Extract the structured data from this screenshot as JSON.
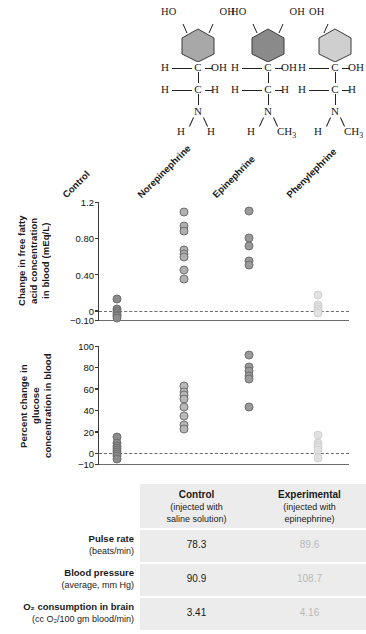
{
  "molecules": [
    {
      "name": "norepinephrine-structure",
      "ring_fill": "#a8a8a8",
      "oh_left": "HO",
      "oh_right": "OH",
      "c1_left": "H",
      "c1": "C",
      "c1_right": "OH",
      "c2_left": "H",
      "c2": "C",
      "c2_right": "H",
      "n": "N",
      "n_left": "H",
      "n_right": "H",
      "n_right_sub": ""
    },
    {
      "name": "epinephrine-structure",
      "ring_fill": "#8a8a8a",
      "oh_left": "HO",
      "oh_right": "OH",
      "c1_left": "H",
      "c1": "C",
      "c1_right": "OH",
      "c2_left": "H",
      "c2": "C",
      "c2_right": "H",
      "n": "N",
      "n_left": "H",
      "n_right": "CH",
      "n_right_sub": "3"
    },
    {
      "name": "phenylephrine-structure",
      "ring_fill": "#cfcfcf",
      "oh_left": "",
      "oh_right": "OH",
      "c1_left": "H",
      "c1": "C",
      "c1_right": "OH",
      "c2_left": "H",
      "c2": "C",
      "c2_right": "H",
      "n": "N",
      "n_left": "H",
      "n_right": "CH",
      "n_right_sub": "3"
    }
  ],
  "groups": [
    {
      "label": "Control",
      "color": "#8c8c8c"
    },
    {
      "label": "Norepinephrine",
      "color": "#b0b0b0"
    },
    {
      "label": "Epinephrine",
      "color": "#9a9a9a"
    },
    {
      "label": "Phenylephrine",
      "color": "#e2e2e2"
    }
  ],
  "chart_data": [
    {
      "type": "scatter",
      "name": "free-fatty-acid-chart",
      "title": "",
      "xlabel": "",
      "ylabel": "Change in free fatty acid concentration in blood (mEq/L)",
      "ylabel_lines": [
        "Change in free fatty",
        "acid concentration",
        "in blood (mEq/L)"
      ],
      "categories": [
        "Control",
        "Norepinephrine",
        "Epinephrine",
        "Phenylephrine"
      ],
      "ylim": [
        -0.1,
        1.2
      ],
      "yticks": [
        1.2,
        0.8,
        0.4,
        0,
        -0.1
      ],
      "ytick_labels": [
        "1.2",
        "0.80",
        "0.40",
        "0",
        "−0.10"
      ],
      "zero_reference": 0,
      "grid": false,
      "legend": "none",
      "series": [
        {
          "name": "Control",
          "color": "#8c8c8c",
          "values": [
            0.13,
            0.02,
            0.0,
            -0.02,
            -0.04,
            -0.06,
            -0.08
          ]
        },
        {
          "name": "Norepinephrine",
          "color": "#b0b0b0",
          "values": [
            1.09,
            0.94,
            0.88,
            0.67,
            0.63,
            0.59,
            0.45,
            0.35
          ]
        },
        {
          "name": "Epinephrine",
          "color": "#9a9a9a",
          "values": [
            1.1,
            0.8,
            0.71,
            0.55,
            0.51
          ]
        },
        {
          "name": "Phenylephrine",
          "color": "#e2e2e2",
          "values": [
            0.18,
            0.06,
            0.04,
            0.02,
            0.0,
            -0.02
          ]
        }
      ]
    },
    {
      "type": "scatter",
      "name": "glucose-chart",
      "title": "",
      "xlabel": "",
      "ylabel": "Percent change in glucose concentration in blood",
      "ylabel_lines": [
        "Percent change in glucose",
        "concentration in blood"
      ],
      "categories": [
        "Control",
        "Norepinephrine",
        "Epinephrine",
        "Phenylephrine"
      ],
      "ylim": [
        -10,
        100
      ],
      "yticks": [
        100,
        80,
        60,
        40,
        20,
        0,
        -10
      ],
      "ytick_labels": [
        "100",
        "80",
        "60",
        "40",
        "20",
        "0",
        "−10"
      ],
      "zero_reference": 0,
      "grid": false,
      "legend": "none",
      "series": [
        {
          "name": "Control",
          "color": "#8c8c8c",
          "values": [
            15,
            10,
            7,
            5,
            3,
            1,
            -1,
            -3,
            -5
          ]
        },
        {
          "name": "Norepinephrine",
          "color": "#b8b8b8",
          "values": [
            63,
            57,
            54,
            51,
            43,
            35,
            26,
            23
          ]
        },
        {
          "name": "Epinephrine",
          "color": "#9a9a9a",
          "values": [
            92,
            80,
            77,
            72,
            69,
            43
          ]
        },
        {
          "name": "Phenylephrine",
          "color": "#e0e0e0",
          "values": [
            17,
            10,
            8,
            6,
            3,
            -4
          ]
        }
      ]
    }
  ],
  "table": {
    "name": "epinephrine-effects-table",
    "columns": [
      {
        "title": "Control",
        "subtitle_lines": [
          "(injected with",
          "saline solution)"
        ]
      },
      {
        "title": "Experimental",
        "subtitle_lines": [
          "(injected with",
          "epinephrine)"
        ]
      }
    ],
    "rows": [
      {
        "label": "Pulse rate",
        "sublabel": "(beats/min)",
        "control": "78.3",
        "experimental": "89.6"
      },
      {
        "label": "Blood pressure",
        "sublabel": "(average, mm Hg)",
        "control": "90.9",
        "experimental": "108.7"
      },
      {
        "label": "O₂ consumption in brain",
        "sublabel": "(cc O₂/100 gm blood/min)",
        "control": "3.41",
        "experimental": "4.16"
      }
    ]
  }
}
